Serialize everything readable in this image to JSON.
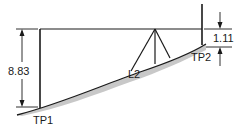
{
  "diagram": {
    "type": "differential-leveling-setup",
    "labels": {
      "backsight_reading": "8.83",
      "foresight_reading": "1.11",
      "turning_point_1": "TP1",
      "turning_point_2": "TP2",
      "level_station": "L2"
    },
    "colors": {
      "line": "#1a1a1a",
      "ground_shade": "#c8c8c8",
      "background": "#ffffff"
    }
  }
}
